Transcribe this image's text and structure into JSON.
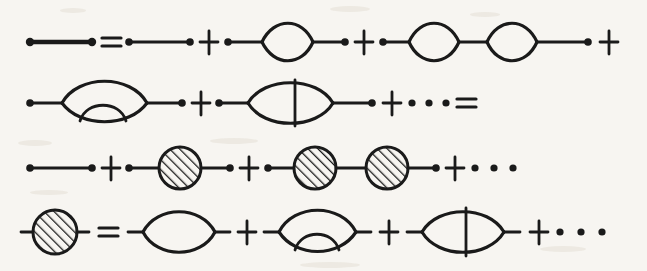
{
  "figure": {
    "background_color": "#f7f5f1",
    "ink_color": "#1a1a1a",
    "width": 647,
    "height": 271,
    "rows": [
      {
        "id": "row-1",
        "y": 42,
        "terms": [
          {
            "kind": "thick-propagator",
            "label": "full propagator line"
          },
          {
            "kind": "operator",
            "label": "="
          },
          {
            "kind": "bare-propagator",
            "label": "free propagator line"
          },
          {
            "kind": "operator",
            "label": "+"
          },
          {
            "kind": "one-loop",
            "label": "single bubble insertion"
          },
          {
            "kind": "operator",
            "label": "+"
          },
          {
            "kind": "two-loop-chain",
            "label": "two bubbles in chain"
          },
          {
            "kind": "operator",
            "label": "+"
          }
        ]
      },
      {
        "id": "row-2",
        "y": 103,
        "terms": [
          {
            "kind": "rainbow-loop",
            "label": "bubble with nested rainbow arc"
          },
          {
            "kind": "operator",
            "label": "+"
          },
          {
            "kind": "crossed-loop",
            "label": "bubble with vertical rung"
          },
          {
            "kind": "operator",
            "label": "+"
          },
          {
            "kind": "ellipsis",
            "label": "• • •"
          },
          {
            "kind": "operator",
            "label": "="
          }
        ]
      },
      {
        "id": "row-3",
        "y": 168,
        "terms": [
          {
            "kind": "bare-propagator",
            "label": "free propagator line"
          },
          {
            "kind": "operator",
            "label": "+"
          },
          {
            "kind": "blob-insertion",
            "label": "line with one hatched self-energy blob"
          },
          {
            "kind": "operator",
            "label": "+"
          },
          {
            "kind": "double-blob-insertion",
            "label": "line with two hatched self-energy blobs"
          },
          {
            "kind": "operator",
            "label": "+"
          },
          {
            "kind": "ellipsis",
            "label": "• • •"
          }
        ]
      },
      {
        "id": "row-4",
        "y": 232,
        "terms": [
          {
            "kind": "hatched-blob",
            "label": "self-energy blob"
          },
          {
            "kind": "operator",
            "label": "="
          },
          {
            "kind": "loop-stub",
            "label": "single bubble"
          },
          {
            "kind": "operator",
            "label": "+"
          },
          {
            "kind": "rainbow-stub",
            "label": "bubble with nested rainbow arc"
          },
          {
            "kind": "operator",
            "label": "+"
          },
          {
            "kind": "crossed-stub",
            "label": "bubble with vertical rung"
          },
          {
            "kind": "operator",
            "label": "+"
          },
          {
            "kind": "ellipsis",
            "label": "• • •"
          }
        ]
      }
    ],
    "operators": {
      "equals": "=",
      "plus": "+",
      "ellipsis": "•  •  •"
    }
  }
}
